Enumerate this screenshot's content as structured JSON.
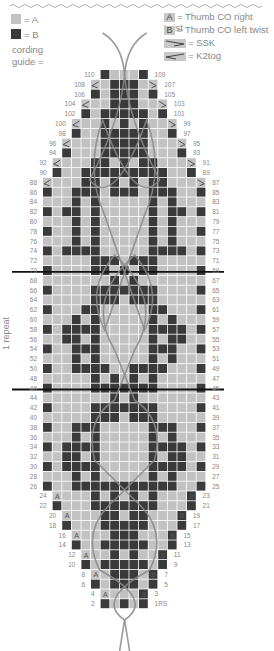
{
  "legend": {
    "swatch_a_label": "= A",
    "swatch_b_label": "= B",
    "cording_guide_label": "cording\nguide =",
    "items": [
      {
        "key": "A",
        "label": "= Thumb CO right twist"
      },
      {
        "key": "B",
        "label": "= Thumb CO left twist"
      },
      {
        "key": "ssk-symbol",
        "label": "= SSK"
      },
      {
        "key": "k2tog-symbol",
        "label": "= K2tog"
      }
    ]
  },
  "chart": {
    "repeat_label": "1 repeat",
    "first_row_suffix": "RS",
    "colors": {
      "A": "#c2c2c2",
      "B": "#3a3a3a",
      "grid": "#ffffff",
      "cord": "#8a8a8a"
    },
    "repeat_lines_at_rows": [
      69,
      45
    ],
    "left_labels": [
      110,
      108,
      106,
      104,
      102,
      100,
      98,
      96,
      94,
      92,
      90,
      88,
      86,
      84,
      82,
      80,
      78,
      76,
      74,
      72,
      70,
      68,
      66,
      64,
      62,
      60,
      58,
      56,
      54,
      52,
      50,
      48,
      46,
      44,
      42,
      40,
      38,
      36,
      34,
      32,
      30,
      28,
      26,
      24,
      22,
      20,
      18,
      16,
      14,
      12,
      10,
      8,
      6,
      4,
      2
    ],
    "right_labels": [
      "109",
      "107",
      "105",
      "103",
      "101",
      "99",
      "97",
      "95",
      "93",
      "91",
      "89",
      "87",
      "85",
      "83",
      "81",
      "79",
      "77",
      "75",
      "73",
      "71",
      "69",
      "67",
      "65",
      "63",
      "61",
      "59",
      "57",
      "55",
      "53",
      "51",
      "49",
      "47",
      "45",
      "43",
      "41",
      "39",
      "37",
      "35",
      "33",
      "31",
      "29",
      "27",
      "25",
      "23",
      "21",
      "19",
      "17",
      "15",
      "13",
      "11",
      "9",
      "7",
      "5",
      "3",
      "1RS"
    ],
    "rows": [
      "......BAaAB......",
      ".....k.BBB.s.....",
      ".....BaBBBaB.....",
      "....k..BBB..s....",
      "....BaBBBBBaB....",
      "...k..BaBaB..s...",
      "...B..BBBBB..B...",
      "..k...BBBBB...s..",
      "..B...BBBBB...B..",
      ".k...BBaBaBB...s.",
      ".B..BBBBBBBBB..B.",
      "k...BBaBaBaBB...s",
      "B..BBBaBBBaBBB..B",
      "a..B.B.....B.B..a",
      "B.BBaB.....BaBB.B",
      "a..B.B.....B.B..a",
      "B..BaB.....BaB..B",
      "a..B.B.....B.B..a",
      "B.BBBB.....BBBB.B",
      "a....BBBaBBB....a",
      "B....BBaBaBB....B",
      "a......BaB......a",
      "B....BBBBBBB....B",
      "a....BBBaBBB....a",
      "B...BB.....BB...B",
      "a..B.B.....B.B..a",
      "B.BBBB.....BBBB.B",
      "a.BB.B.....B.BB.a",
      "B..BBB.....BBB..B",
      "a..B.B.....B.B..a",
      "B..BBBBaaBBBB...B",
      "a....BaBaBaB....a",
      "B....BBBBBBB....B",
      "a......BaB......a",
      "B....BBBBBBB....B",
      "a....BBBaBBB....a",
      "B..BBB.....BBB..B",
      "a..B.B.....B.B..a",
      "B.BBBB.....BBBB.B",
      "a.BB.B.....B.BB.a",
      "B.BBBB.....BBBB.B",
      "a..B.B.....B.B..a",
      "B..BBBBBBBBBBB..B",
      ".A...BaBaBaB...B.",
      ".B...BBBBBBB...B.",
      "..A...BBaBB...B..",
      "..B...BBBBB...B..",
      "...A...BBB...B...",
      "...B..BBBBB..B...",
      "....A..BaB..B....",
      "....B.BBBBB.B....",
      ".....A.BBB.B.....",
      ".....B.BBB.B.....",
      "......AaaaB......",
      "......B.B.B......"
    ]
  }
}
